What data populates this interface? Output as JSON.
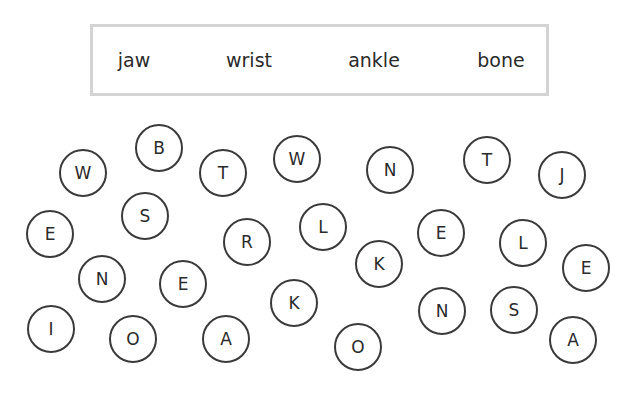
{
  "word_bank": {
    "words": [
      {
        "text": "jaw",
        "x": 41
      },
      {
        "text": "wrist",
        "x": 156
      },
      {
        "text": "ankle",
        "x": 281
      },
      {
        "text": "bone",
        "x": 408
      }
    ]
  },
  "letters": [
    {
      "char": "W",
      "x": 83,
      "y": 173
    },
    {
      "char": "B",
      "x": 159,
      "y": 148
    },
    {
      "char": "T",
      "x": 223,
      "y": 173
    },
    {
      "char": "W",
      "x": 297,
      "y": 159
    },
    {
      "char": "N",
      "x": 390,
      "y": 170
    },
    {
      "char": "T",
      "x": 487,
      "y": 160
    },
    {
      "char": "J",
      "x": 562,
      "y": 175
    },
    {
      "char": "E",
      "x": 50,
      "y": 234
    },
    {
      "char": "S",
      "x": 145,
      "y": 216
    },
    {
      "char": "R",
      "x": 247,
      "y": 242
    },
    {
      "char": "L",
      "x": 323,
      "y": 227
    },
    {
      "char": "K",
      "x": 379,
      "y": 264
    },
    {
      "char": "E",
      "x": 441,
      "y": 233
    },
    {
      "char": "L",
      "x": 523,
      "y": 243
    },
    {
      "char": "E",
      "x": 586,
      "y": 268
    },
    {
      "char": "N",
      "x": 102,
      "y": 279
    },
    {
      "char": "E",
      "x": 183,
      "y": 284
    },
    {
      "char": "K",
      "x": 294,
      "y": 303
    },
    {
      "char": "N",
      "x": 442,
      "y": 311
    },
    {
      "char": "S",
      "x": 514,
      "y": 310
    },
    {
      "char": "I",
      "x": 51,
      "y": 329
    },
    {
      "char": "O",
      "x": 133,
      "y": 339
    },
    {
      "char": "A",
      "x": 226,
      "y": 339
    },
    {
      "char": "O",
      "x": 358,
      "y": 347
    },
    {
      "char": "A",
      "x": 573,
      "y": 340
    }
  ]
}
